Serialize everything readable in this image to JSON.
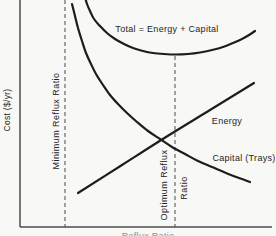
{
  "figure": {
    "y_axis_label": "Cost ($/yr)",
    "x_axis_label_clipped": "Reflux Ratio",
    "labels": {
      "total": "Total = Energy + Capital",
      "energy": "Energy",
      "capital": "Capital (Trays)",
      "minimum_reflux": "Minimum Reflux Ratio",
      "optimum_reflux_line1": "Optimum Reflux",
      "optimum_reflux_line2": "Ratio"
    },
    "colors": {
      "background": "#f8f8f6",
      "curve": "#1d1d1d",
      "axis": "#4c4c4c",
      "dashed_line": "#5a5a5a",
      "text": "#242424",
      "clipped_text": "#8f8f8f"
    }
  },
  "chart_data": {
    "type": "line",
    "title": "",
    "xlabel": "Reflux Ratio",
    "ylabel": "Cost ($/yr)",
    "qualitative": true,
    "axis_ticks": "none",
    "legend": "inline curve annotations",
    "series": [
      {
        "name": "Total = Energy + Capital",
        "shape": "U-shaped curve with minimum at optimum reflux ratio",
        "points_px": [
          [
            85,
            -3
          ],
          [
            87,
            4
          ],
          [
            90,
            11
          ],
          [
            94,
            19
          ],
          [
            100,
            26
          ],
          [
            107,
            33
          ],
          [
            115,
            39
          ],
          [
            124,
            44
          ],
          [
            133,
            48
          ],
          [
            143,
            51
          ],
          [
            153,
            53
          ],
          [
            164,
            54
          ],
          [
            176,
            54.5
          ],
          [
            188,
            54
          ],
          [
            200,
            52.5
          ],
          [
            212,
            50
          ],
          [
            223,
            47
          ],
          [
            233,
            43
          ],
          [
            242,
            39
          ],
          [
            249,
            35
          ],
          [
            255,
            31
          ]
        ]
      },
      {
        "name": "Capital (Trays)",
        "shape": "steeply decreasing, flattening to the right",
        "points_px": [
          [
            72,
            4
          ],
          [
            75,
            16
          ],
          [
            78,
            28
          ],
          [
            82,
            41
          ],
          [
            86,
            53
          ],
          [
            91,
            64
          ],
          [
            96,
            74
          ],
          [
            103,
            85
          ],
          [
            110,
            95
          ],
          [
            118,
            104
          ],
          [
            127,
            113
          ],
          [
            137,
            122
          ],
          [
            148,
            131
          ],
          [
            160,
            139
          ],
          [
            172,
            147
          ],
          [
            185,
            154
          ],
          [
            198,
            161
          ],
          [
            212,
            167
          ],
          [
            226,
            173
          ],
          [
            239,
            178
          ],
          [
            250,
            182
          ]
        ]
      },
      {
        "name": "Energy",
        "shape": "straight increasing line, crosses Capital near optimum",
        "points_px": [
          [
            78,
            193
          ],
          [
            122,
            165
          ],
          [
            166,
            137
          ],
          [
            210,
            110
          ],
          [
            254,
            83
          ]
        ]
      }
    ],
    "reference_lines": [
      {
        "name": "Minimum Reflux Ratio",
        "style": "dashed",
        "x_px": 65,
        "y1_px": 0,
        "y2_px": 227
      },
      {
        "name": "Optimum Reflux Ratio",
        "style": "dashed",
        "x_px": 175,
        "y1_px": 56,
        "y2_px": 227
      }
    ],
    "axes": {
      "y_axis_x_px": 20,
      "x_axis_y_px": 227,
      "x_axis_end_px": 272
    }
  }
}
